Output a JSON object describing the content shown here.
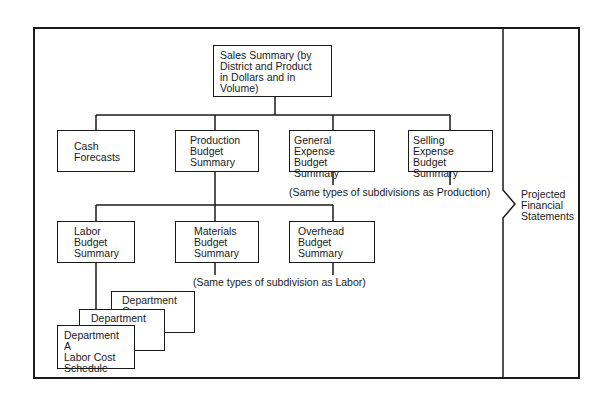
{
  "diagram": {
    "root": {
      "label": "Sales Summary (by\nDistrict and Product\nin Dollars and in\nVolume)"
    },
    "level1": [
      {
        "id": "cash",
        "label": "Cash\nForecasts"
      },
      {
        "id": "production",
        "label": "Production\nBudget\nSummary"
      },
      {
        "id": "general",
        "label": "General Expense\nBudget\nSummary"
      },
      {
        "id": "selling",
        "label": "Selling Expense\nBudget\nSummary"
      }
    ],
    "level1_note": "(Same types of subdivisions as Production)",
    "level2": [
      {
        "id": "labor",
        "label": "Labor\nBudget\nSummary"
      },
      {
        "id": "materials",
        "label": "Materials\nBudget\nSummary"
      },
      {
        "id": "overhead",
        "label": "Overhead\nBudget\nSummary"
      }
    ],
    "level2_note": "(Same types of subdivision as Labor)",
    "departments": [
      {
        "id": "dept-c",
        "label": "Department C"
      },
      {
        "id": "dept-b",
        "label": "Department B"
      },
      {
        "id": "dept-a",
        "label": "Department A\nLabor Cost\nSchedule"
      }
    ],
    "output": {
      "label": "Projected\nFinancial\nStatements"
    }
  }
}
